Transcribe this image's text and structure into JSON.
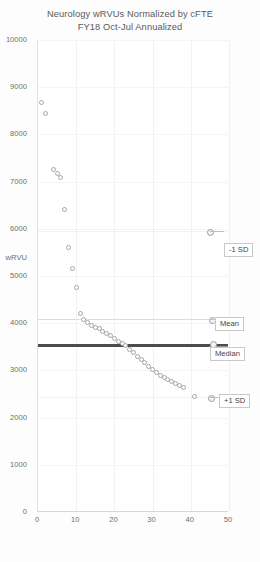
{
  "chart_data": {
    "type": "scatter",
    "title": "Neurology wRVUs Normalized by cFTE",
    "subtitle": "FY18 Oct-Jul Annualized",
    "xlabel": "Physician",
    "ylabel": "wRVU",
    "xlim": [
      0,
      50
    ],
    "ylim": [
      0,
      10000
    ],
    "grid": true,
    "legend": "none",
    "x_ticks": [
      "0",
      "10",
      "20",
      "30",
      "40",
      "50"
    ],
    "y_ticks": [
      "0",
      "1000",
      "2000",
      "3000",
      "4000",
      "5000",
      "6000",
      "7000",
      "8000",
      "9000",
      "10000"
    ],
    "x": [
      1,
      2,
      4,
      5,
      6,
      7,
      8,
      9,
      10,
      11,
      12,
      13,
      14,
      15,
      16,
      17,
      18,
      19,
      20,
      21,
      22,
      23,
      24,
      25,
      26,
      27,
      28,
      29,
      30,
      31,
      32,
      33,
      34,
      35,
      36,
      37,
      38,
      41
    ],
    "y": [
      8680,
      8450,
      7250,
      7180,
      7090,
      6400,
      5600,
      5150,
      4750,
      4200,
      4080,
      4020,
      3960,
      3910,
      3880,
      3830,
      3790,
      3740,
      3680,
      3620,
      3570,
      3520,
      3440,
      3380,
      3300,
      3230,
      3160,
      3090,
      3020,
      2960,
      2900,
      2850,
      2800,
      2760,
      2720,
      2690,
      2640,
      2450
    ],
    "series_name": "wRVU per cFTE",
    "reference_lines": [
      {
        "name": "-1 SD",
        "value": 5950,
        "style": "light"
      },
      {
        "name": "Mean",
        "value": 4080,
        "style": "light"
      },
      {
        "name": "Median",
        "value": 3560,
        "style": "heavy"
      },
      {
        "name": "+1 SD",
        "value": 2430,
        "style": "light"
      }
    ]
  },
  "annotations": {
    "sd_minus": "-1 SD",
    "mean": "Mean",
    "median": "Median",
    "sd_plus": "+1 SD"
  }
}
